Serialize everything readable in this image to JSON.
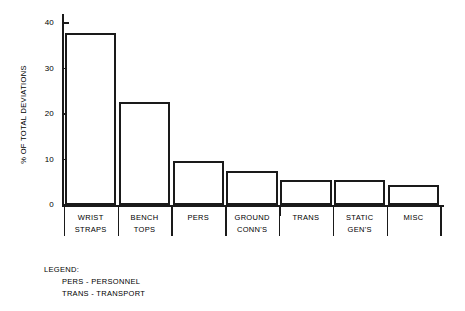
{
  "chart_data": {
    "type": "bar",
    "title": "",
    "xlabel": "",
    "ylabel": "% OF TOTAL DEVIATIONS",
    "ylim": [
      0,
      42
    ],
    "yticks": [
      0,
      10,
      20,
      30,
      40
    ],
    "ytick_labels": [
      "0",
      "10",
      "20",
      "30",
      "40"
    ],
    "grid": false,
    "legend_position": "below-left",
    "categories": [
      "WRIST STRAPS",
      "BENCH TOPS",
      "PERS",
      "GROUND CONN'S",
      "TRANS",
      "STATIC GEN'S",
      "MISC"
    ],
    "values": [
      37.8,
      22.7,
      9.7,
      7.4,
      5.6,
      5.6,
      4.4
    ]
  },
  "axis": {
    "y_title": "% OF TOTAL DEVIATIONS",
    "y_ticks": [
      {
        "label": "40",
        "value": 40
      },
      {
        "label": "30",
        "value": 30
      },
      {
        "label": "20",
        "value": 20
      },
      {
        "label": "10",
        "value": 10
      },
      {
        "label": "0",
        "value": 0
      }
    ]
  },
  "categories": [
    {
      "line1": "WRIST",
      "line2": "STRAPS",
      "value": 37.8
    },
    {
      "line1": "BENCH",
      "line2": "TOPS",
      "value": 22.7
    },
    {
      "line1": "PERS",
      "line2": "",
      "value": 9.7
    },
    {
      "line1": "GROUND",
      "line2": "CONN'S",
      "value": 7.4
    },
    {
      "line1": "TRANS",
      "line2": "",
      "value": 5.6
    },
    {
      "line1": "STATIC",
      "line2": "GEN'S",
      "value": 5.6
    },
    {
      "line1": "MISC",
      "line2": "",
      "value": 4.4
    }
  ],
  "legend": {
    "title": "LEGEND:",
    "entries": [
      "PERS - PERSONNEL",
      "TRANS - TRANSPORT"
    ]
  },
  "colors": {
    "ink": "#1a1a1a",
    "background": "#ffffff",
    "bar_fill": "#ffffff"
  }
}
